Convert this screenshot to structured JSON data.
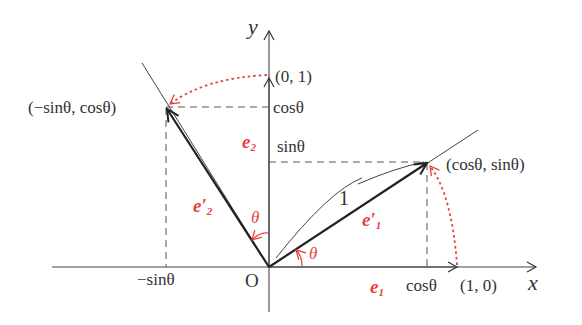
{
  "diagram": {
    "colors": {
      "ink": "#333333",
      "accent": "#e8403c"
    },
    "axes": {
      "x_label": "x",
      "y_label": "y",
      "origin_label": "O"
    },
    "points": {
      "e1_end": "(1, 0)",
      "e2_end": "(0, 1)",
      "e1_rot": "(cosθ, sinθ)",
      "e2_rot": "(−sinθ, cosθ)"
    },
    "ticks": {
      "x_cos": "cosθ",
      "x_neg_sin": "−sinθ",
      "y_cos": "cosθ",
      "y_sin": "sinθ"
    },
    "vectors": {
      "e1": "e",
      "e1_sub": "1",
      "e2": "e",
      "e2_sub": "2",
      "e1_prime": "e′",
      "e1_prime_sub": "1",
      "e2_prime": "e′",
      "e2_prime_sub": "2"
    },
    "angles": {
      "theta_1": "θ",
      "theta_2": "θ"
    },
    "length_label": "1",
    "geometry": {
      "origin_px": [
        269,
        267
      ],
      "unit_radius_px": 190,
      "theta_deg": 32
    }
  }
}
